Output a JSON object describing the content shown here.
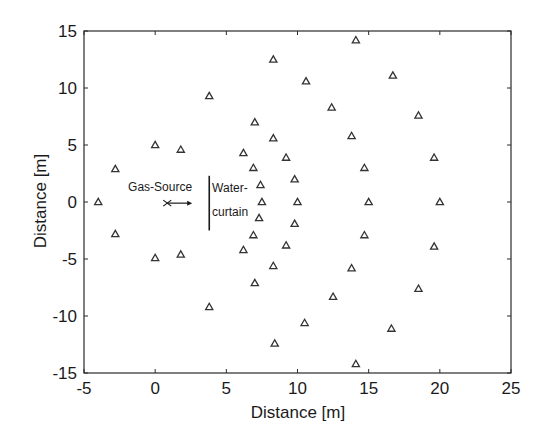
{
  "chart_data": {
    "type": "scatter",
    "title": "",
    "xlabel": "Distance [m]",
    "ylabel": "Distance [m]",
    "xlim": [
      -5,
      25
    ],
    "ylim": [
      -15,
      15
    ],
    "xticks": [
      -5,
      0,
      5,
      10,
      15,
      20,
      25
    ],
    "yticks": [
      -15,
      -10,
      -5,
      0,
      5,
      10,
      15
    ],
    "grid": false,
    "legend": null,
    "series": [
      {
        "name": "sensors",
        "marker": "triangle",
        "points": [
          [
            -4.0,
            0.0
          ],
          [
            -2.8,
            2.9
          ],
          [
            -2.8,
            -2.8
          ],
          [
            0.0,
            5.0
          ],
          [
            0.0,
            -4.9
          ],
          [
            1.8,
            4.6
          ],
          [
            1.8,
            -4.6
          ],
          [
            3.8,
            9.3
          ],
          [
            3.8,
            -9.2
          ],
          [
            6.2,
            4.3
          ],
          [
            6.9,
            3.0
          ],
          [
            7.4,
            1.5
          ],
          [
            7.5,
            0.0
          ],
          [
            7.3,
            -1.4
          ],
          [
            6.9,
            -2.9
          ],
          [
            6.2,
            -4.2
          ],
          [
            7.0,
            7.0
          ],
          [
            7.0,
            -7.1
          ],
          [
            8.3,
            5.6
          ],
          [
            8.3,
            -5.6
          ],
          [
            9.2,
            3.9
          ],
          [
            9.8,
            2.0
          ],
          [
            10.0,
            0.0
          ],
          [
            9.8,
            -1.9
          ],
          [
            9.2,
            -3.8
          ],
          [
            8.3,
            12.5
          ],
          [
            8.4,
            -12.4
          ],
          [
            10.6,
            10.6
          ],
          [
            10.5,
            -10.6
          ],
          [
            12.4,
            8.3
          ],
          [
            12.5,
            -8.3
          ],
          [
            13.8,
            5.8
          ],
          [
            13.8,
            -5.8
          ],
          [
            14.7,
            3.0
          ],
          [
            15.0,
            0.0
          ],
          [
            14.7,
            -2.9
          ],
          [
            14.1,
            14.2
          ],
          [
            14.1,
            -14.2
          ],
          [
            16.7,
            11.1
          ],
          [
            16.6,
            -11.1
          ],
          [
            18.5,
            7.6
          ],
          [
            18.5,
            -7.6
          ],
          [
            19.6,
            3.9
          ],
          [
            20.0,
            0.0
          ],
          [
            19.6,
            -3.9
          ]
        ]
      }
    ],
    "annotations": [
      {
        "text": "Gas-Source",
        "type": "label",
        "x": -1.9,
        "y": 1.0
      },
      {
        "type": "source-marker",
        "x": 0.85,
        "y": -0.1,
        "arrow_to_x": 2.6
      },
      {
        "type": "water-curtain-line",
        "x": 3.8,
        "y_from": 2.3,
        "y_to": -2.5
      },
      {
        "text": "Water-",
        "type": "label",
        "x": 4.0,
        "y": 0.9
      },
      {
        "text": "curtain",
        "type": "label",
        "x": 4.0,
        "y": -1.2
      }
    ]
  },
  "labels": {
    "xlabel": "Distance [m]",
    "ylabel": "Distance [m]",
    "gas_source": "Gas-Source",
    "water_line1": "Water-",
    "water_line2": "curtain"
  },
  "colors": {
    "frame": "#2a2a2a",
    "marker": "#333333",
    "text": "#1a1a1a",
    "background": "#ffffff"
  }
}
